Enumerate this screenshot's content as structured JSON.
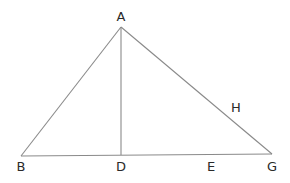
{
  "diagram": {
    "type": "geometry-triangle",
    "points": {
      "A": {
        "label": "A",
        "x": 121,
        "y": 27
      },
      "B": {
        "label": "B",
        "x": 21,
        "y": 156
      },
      "D": {
        "label": "D",
        "x": 121,
        "y": 155
      },
      "E": {
        "label": "E",
        "x": 211,
        "y": 155
      },
      "G": {
        "label": "G",
        "x": 272,
        "y": 154
      },
      "H": {
        "label": "H",
        "x": 236,
        "y": 107
      }
    },
    "segments": [
      {
        "from": "A",
        "to": "B"
      },
      {
        "from": "A",
        "to": "G"
      },
      {
        "from": "B",
        "to": "G"
      },
      {
        "from": "A",
        "to": "D"
      }
    ],
    "labels": {
      "A": "A",
      "B": "B",
      "D": "D",
      "E": "E",
      "G": "G",
      "H": "H"
    },
    "line_color": "#8a8a8a",
    "text_color": "#2a2a2a"
  }
}
